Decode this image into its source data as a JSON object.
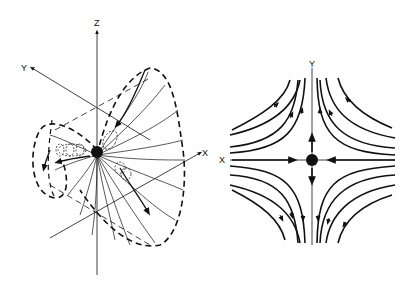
{
  "left_figure": {
    "axis_labels": {
      "z": "Z",
      "y": "Y",
      "x": "X"
    },
    "description": "3D field lines around a point source with dashed envelope"
  },
  "right_figure": {
    "axis_labels": {
      "y": "Y",
      "x": "X"
    },
    "description": "2D saddle-point flow field: inflow along X, outflow along Y"
  },
  "colors": {
    "ink": "#111111",
    "background": "#ffffff"
  }
}
